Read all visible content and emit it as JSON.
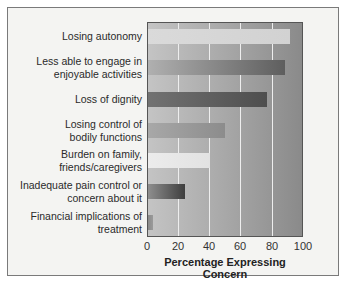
{
  "chart_data": {
    "type": "bar",
    "orientation": "horizontal",
    "title": "",
    "xlabel": "Percentage Expressing Concern",
    "ylabel": "",
    "xlim": [
      0,
      100
    ],
    "xticks": [
      "0",
      "20",
      "40",
      "60",
      "80",
      "100"
    ],
    "grid": true,
    "legend": null,
    "categories": [
      "Losing autonomy",
      "Less able to engage in enjoyable activities",
      "Loss of dignity",
      "Losing control of bodily functions",
      "Burden on family, friends/caregivers",
      "Inadequate pain control or concern about it",
      "Financial implications of treatment"
    ],
    "values": [
      92,
      89,
      77,
      50,
      40,
      24,
      3
    ]
  },
  "labels": [
    "Losing autonomy",
    "Less able to engage in\nenjoyable activities",
    "Loss of dignity",
    "Losing control of\nbodily functions",
    "Burden on family,\nfriends/caregivers",
    "Inadequate pain control or\nconcern about it",
    "Financial implications of\ntreatment"
  ],
  "ticks": [
    "0",
    "20",
    "40",
    "60",
    "80",
    "100"
  ],
  "xlabel": "Percentage Expressing Concern",
  "bar_colors": [
    "linear-gradient(to right, #dadada, #d2d2d2)",
    "linear-gradient(to right, #b0b0b0, #5e5e5e)",
    "linear-gradient(to right, #727272, #4e4e4e)",
    "linear-gradient(to right, #a8a8a8, #8c8c8c)",
    "linear-gradient(to right, #ececec, #e2e2e2)",
    "linear-gradient(to right, #8e8e8e, #3e3e3e)",
    "linear-gradient(to right, #8a8a8a, #9a9a9a)"
  ]
}
